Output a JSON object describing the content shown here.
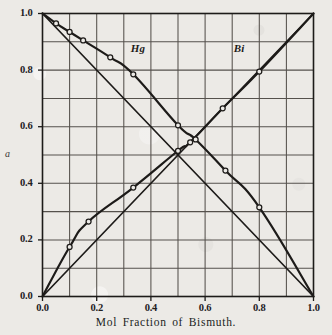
{
  "figure": {
    "background_color": "#eceae6",
    "ink_color": "#1d1b19",
    "grid_color": "#55514c"
  },
  "chart_data": {
    "type": "line",
    "title": "",
    "subtitle": "",
    "xlabel": "Mol Fraction of Bismuth.",
    "ylabel": "a",
    "xlim": [
      0.0,
      1.0
    ],
    "ylim": [
      0.0,
      1.0
    ],
    "grid": true,
    "grid_step": 0.1,
    "legend_position": "inline-annotations",
    "x_ticks": [
      0.0,
      0.2,
      0.4,
      0.6,
      0.8,
      1.0
    ],
    "x_tick_labels": [
      "0.0",
      "0.2",
      "0.4",
      "0.6",
      "0.8",
      "1.0"
    ],
    "y_ticks": [
      0.0,
      0.2,
      0.4,
      0.6,
      0.8,
      1.0
    ],
    "y_tick_labels": [
      "0.0",
      "0.2",
      "0.4",
      "0.6",
      "0.8",
      "1.0"
    ],
    "annotations": [
      {
        "text": "Hg",
        "x": 0.355,
        "y": 0.875
      },
      {
        "text": "Bi",
        "x": 0.735,
        "y": 0.875
      }
    ],
    "series": [
      {
        "name": "Hg",
        "kind": "measured-curve",
        "marker": "open-circle",
        "x": [
          0.0,
          0.05,
          0.1,
          0.15,
          0.25,
          0.335,
          0.5,
          0.565,
          0.675,
          0.8,
          1.0
        ],
        "y": [
          1.0,
          0.965,
          0.935,
          0.905,
          0.845,
          0.785,
          0.605,
          0.555,
          0.445,
          0.315,
          0.0
        ]
      },
      {
        "name": "Bi",
        "kind": "measured-curve",
        "marker": "open-circle",
        "x": [
          0.0,
          0.1,
          0.17,
          0.335,
          0.5,
          0.545,
          0.665,
          0.8,
          1.0
        ],
        "y": [
          0.0,
          0.175,
          0.265,
          0.385,
          0.515,
          0.545,
          0.665,
          0.795,
          1.0
        ]
      },
      {
        "name": "Raoult ideal line (Hg)",
        "kind": "reference-line",
        "marker": "none",
        "x": [
          0.0,
          1.0
        ],
        "y": [
          1.0,
          0.0
        ]
      },
      {
        "name": "Raoult ideal line (Bi)",
        "kind": "reference-line",
        "marker": "none",
        "x": [
          0.0,
          1.0
        ],
        "y": [
          0.0,
          1.0
        ]
      }
    ]
  }
}
